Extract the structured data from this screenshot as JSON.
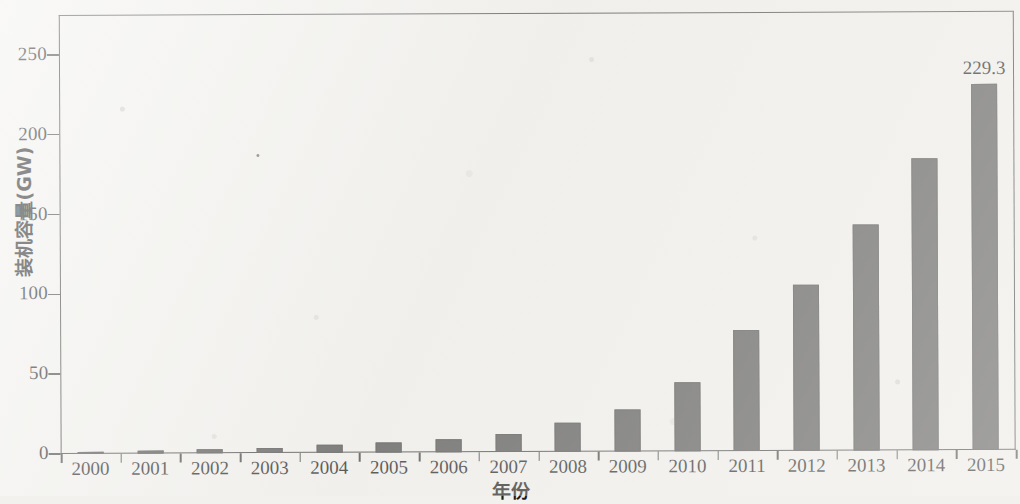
{
  "chart_data": {
    "type": "bar",
    "title": "",
    "xlabel": "年份",
    "ylabel": "装机容量(GW)",
    "categories": [
      "2000",
      "2001",
      "2002",
      "2003",
      "2004",
      "2005",
      "2006",
      "2007",
      "2008",
      "2009",
      "2010",
      "2011",
      "2012",
      "2013",
      "2014",
      "2015"
    ],
    "values": [
      1.5,
      1.8,
      2.5,
      3.0,
      5.0,
      6.0,
      8.0,
      11.5,
      18.0,
      26.0,
      43.5,
      75.5,
      104.0,
      141.5,
      183.0,
      229.3
    ],
    "value_labels": [
      "",
      "",
      "",
      "",
      "",
      "",
      "",
      "",
      "",
      "",
      "",
      "",
      "",
      "",
      "",
      "229.3"
    ],
    "ylim": [
      0,
      275
    ],
    "yticks": [
      0,
      50,
      100,
      150,
      200,
      250
    ],
    "ytick_labels": [
      "0",
      "50",
      "100",
      "150",
      "200",
      "250"
    ],
    "grid": false,
    "legend": null,
    "bar_color": "#4f4f4f",
    "axis_color": "#3a3a3a",
    "background_color": "#f2f1ee"
  },
  "axes": {
    "y_title": "装机容量(GW)",
    "x_title": "年份"
  },
  "annotations": {
    "last_bar_value": "229.3"
  }
}
